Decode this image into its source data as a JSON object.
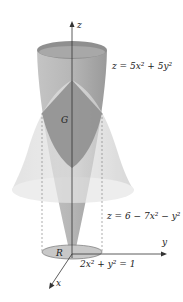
{
  "figure": {
    "axes": {
      "z_label": "z",
      "y_label": "y",
      "x_label": "x"
    },
    "surfaces": {
      "upper": {
        "equation": "z = 5x² + 5y²"
      },
      "lower": {
        "equation": "z = 6 − 7x² − y²"
      }
    },
    "region_labels": {
      "solid": "G",
      "base": "R"
    },
    "base_boundary": {
      "equation": "2x² + y² = 1"
    }
  },
  "colors": {
    "paraboloid_up": "#a8a8a8",
    "paraboloid_down": "#d0d0d0",
    "intersection": "#8c8c8c",
    "base_region": "#c8c8c8",
    "axis": "#333333"
  }
}
